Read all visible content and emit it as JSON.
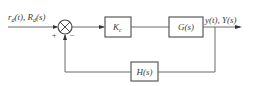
{
  "diagram": {
    "type": "feedback-control-block-diagram",
    "input_label": "r",
    "input_sub": "d",
    "input_mid": "(t), R",
    "input_sub2": "d",
    "input_end": "(s)",
    "summing_junction": {
      "plus_sign": "+",
      "minus_sign": "–"
    },
    "blocks": {
      "controller": {
        "label": "K",
        "sub": "c"
      },
      "plant": {
        "label": "G(s)"
      },
      "feedback": {
        "label": "H(s)"
      }
    },
    "output_label": "y(t), Y(s)",
    "colors": {
      "line": "#6a6a6a",
      "box_border": "#5a5a5a",
      "text": "#3a3a3a",
      "background": "#ffffff"
    }
  }
}
